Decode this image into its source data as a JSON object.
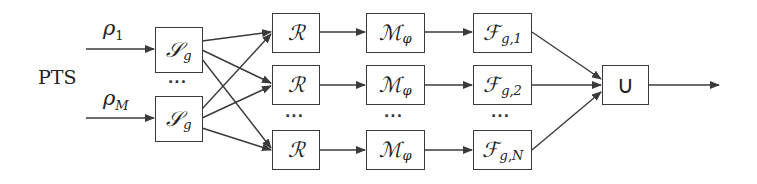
{
  "input": {
    "label": "PTS",
    "rho_symbol": "ρ",
    "rho_1_sub": "1",
    "rho_M_sub": "M"
  },
  "stages": {
    "splitter": {
      "symbol": "𝒮",
      "sub": "g"
    },
    "reconstruct": {
      "symbol": "ℛ"
    },
    "map": {
      "symbol": "ℳ",
      "sub": "φ"
    },
    "filter": {
      "symbol": "ℱ",
      "subs": [
        "g,1",
        "g,2",
        "g,N"
      ]
    },
    "union": {
      "symbol": "∪"
    }
  },
  "ellipsis": "···",
  "colors": {
    "line": "#3a3a3a",
    "text": "#222222",
    "background": "#ffffff"
  }
}
